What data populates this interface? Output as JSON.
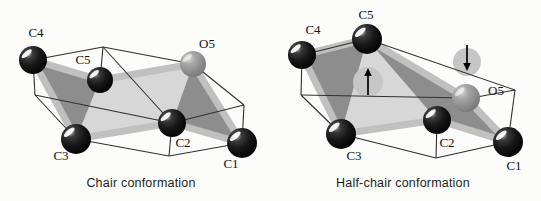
{
  "figure": {
    "width": 541,
    "height": 201,
    "background": "#fcfcfb",
    "colors": {
      "plane_light": "#d7d7d7",
      "plane_dark": "#8d8d8d",
      "bond": "#c0c0c0",
      "wireframe": "#303030",
      "ghost": "#c6c6c6",
      "arrow": "#000000",
      "label": "#141414",
      "caption": "#1f1f1f"
    },
    "diagrams": [
      {
        "id": "chair",
        "caption": "Chair conformation",
        "caption_x": 141,
        "caption_y": 187,
        "atoms": [
          {
            "label": "C4",
            "element": "C",
            "x": 33,
            "y": 60,
            "r": 14,
            "lx": 36,
            "ly": 37
          },
          {
            "label": "C5",
            "element": "C",
            "x": 100,
            "y": 80,
            "r": 13,
            "lx": 83,
            "ly": 64
          },
          {
            "label": "O5",
            "element": "O",
            "x": 193,
            "y": 64,
            "r": 13,
            "lx": 207,
            "ly": 48
          },
          {
            "label": "C3",
            "element": "C",
            "x": 76,
            "y": 139,
            "r": 15,
            "lx": 61,
            "ly": 160
          },
          {
            "label": "C2",
            "element": "C",
            "x": 172,
            "y": 123,
            "r": 14,
            "lx": 183,
            "ly": 147
          },
          {
            "label": "C1",
            "element": "C",
            "x": 242,
            "y": 143,
            "r": 15,
            "lx": 231,
            "ly": 168
          }
        ],
        "planes": [
          {
            "shade": "light",
            "points": [
              [
                100,
                80
              ],
              [
                193,
                64
              ],
              [
                172,
                123
              ],
              [
                76,
                139
              ]
            ]
          },
          {
            "shade": "dark",
            "points": [
              [
                33,
                60
              ],
              [
                100,
                80
              ],
              [
                76,
                139
              ]
            ]
          },
          {
            "shade": "dark",
            "points": [
              [
                193,
                64
              ],
              [
                242,
                143
              ],
              [
                172,
                123
              ]
            ]
          }
        ],
        "bonds": [
          [
            "C4",
            "C5"
          ],
          [
            "C4",
            "C3"
          ],
          [
            "C3",
            "C2"
          ],
          [
            "C2",
            "C1"
          ],
          [
            "C5",
            "O5"
          ],
          [
            "O5",
            "C1"
          ]
        ],
        "box": [
          [
            [
              33,
              60
            ],
            [
              103,
              47
            ]
          ],
          [
            [
              103,
              47
            ],
            [
              193,
              64
            ]
          ],
          [
            [
              193,
              64
            ],
            [
              244,
              105
            ]
          ],
          [
            [
              244,
              105
            ],
            [
              242,
              143
            ]
          ],
          [
            [
              242,
              143
            ],
            [
              169,
              156
            ]
          ],
          [
            [
              169,
              156
            ],
            [
              76,
              139
            ]
          ],
          [
            [
              76,
              139
            ],
            [
              35,
              95
            ]
          ],
          [
            [
              35,
              95
            ],
            [
              33,
              60
            ]
          ],
          [
            [
              103,
              47
            ],
            [
              100,
              80
            ]
          ],
          [
            [
              172,
              123
            ],
            [
              169,
              156
            ]
          ],
          [
            [
              244,
              105
            ],
            [
              172,
              123
            ]
          ],
          [
            [
              103,
              47
            ],
            [
              172,
              123
            ]
          ],
          [
            [
              35,
              95
            ],
            [
              172,
              123
            ]
          ]
        ],
        "ghosts": [],
        "arrows": []
      },
      {
        "id": "half-chair",
        "caption": "Half-chair conformation",
        "caption_x": 403,
        "caption_y": 187,
        "atoms": [
          {
            "label": "C4",
            "element": "C",
            "x": 302,
            "y": 55,
            "r": 14,
            "lx": 313,
            "ly": 34
          },
          {
            "label": "C5",
            "element": "C",
            "x": 367,
            "y": 39,
            "r": 15,
            "lx": 366,
            "ly": 19
          },
          {
            "label": "O5",
            "element": "O",
            "x": 466,
            "y": 98,
            "r": 14,
            "lx": 496,
            "ly": 95
          },
          {
            "label": "C3",
            "element": "C",
            "x": 341,
            "y": 134,
            "r": 15,
            "lx": 354,
            "ly": 160
          },
          {
            "label": "C2",
            "element": "C",
            "x": 437,
            "y": 120,
            "r": 14,
            "lx": 447,
            "ly": 147
          },
          {
            "label": "C1",
            "element": "C",
            "x": 508,
            "y": 142,
            "r": 15,
            "lx": 514,
            "ly": 170
          }
        ],
        "planes": [
          {
            "shade": "light",
            "points": [
              [
                367,
                39
              ],
              [
                466,
                98
              ],
              [
                437,
                120
              ],
              [
                341,
                134
              ]
            ]
          },
          {
            "shade": "dark",
            "points": [
              [
                302,
                55
              ],
              [
                367,
                39
              ],
              [
                341,
                134
              ]
            ]
          },
          {
            "shade": "dark",
            "points": [
              [
                367,
                39
              ],
              [
                466,
                98
              ],
              [
                508,
                142
              ],
              [
                437,
                120
              ]
            ]
          }
        ],
        "bonds": [
          [
            "C4",
            "C5"
          ],
          [
            "C4",
            "C3"
          ],
          [
            "C3",
            "C2"
          ],
          [
            "C2",
            "C1"
          ],
          [
            "C5",
            "O5"
          ],
          [
            "O5",
            "C1"
          ]
        ],
        "box": [
          [
            [
              302,
              55
            ],
            [
              367,
              39
            ]
          ],
          [
            [
              367,
              39
            ],
            [
              515,
              90
            ]
          ],
          [
            [
              515,
              90
            ],
            [
              508,
              142
            ]
          ],
          [
            [
              508,
              142
            ],
            [
              436,
              158
            ]
          ],
          [
            [
              436,
              158
            ],
            [
              341,
              134
            ]
          ],
          [
            [
              341,
              134
            ],
            [
              301,
              95
            ]
          ],
          [
            [
              301,
              95
            ],
            [
              302,
              55
            ]
          ],
          [
            [
              301,
              95
            ],
            [
              466,
              98
            ]
          ],
          [
            [
              466,
              99
            ],
            [
              515,
              90
            ]
          ],
          [
            [
              437,
              120
            ],
            [
              436,
              158
            ]
          ]
        ],
        "ghosts": [
          {
            "x": 368,
            "y": 82,
            "r": 15
          },
          {
            "x": 467,
            "y": 62,
            "r": 14
          }
        ],
        "arrows": [
          {
            "direction": "up",
            "x": 368,
            "shaft_from": 95,
            "shaft_to": 76,
            "tip": 68
          },
          {
            "direction": "down",
            "x": 467,
            "shaft_from": 45,
            "shaft_to": 63,
            "tip": 71
          }
        ]
      }
    ]
  }
}
